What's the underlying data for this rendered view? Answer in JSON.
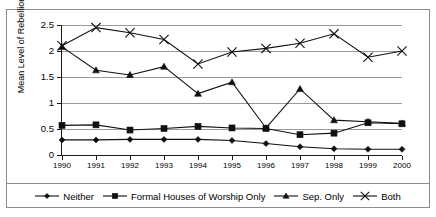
{
  "chart_data": {
    "type": "line",
    "title": "",
    "xlabel": "",
    "ylabel": "Mean Level of Rebellion",
    "categories": [
      "1990",
      "1991",
      "1992",
      "1993",
      "1994",
      "1995",
      "1996",
      "1997",
      "1998",
      "1999",
      "2000"
    ],
    "ylim": [
      0,
      2.5
    ],
    "yticks": [
      "0",
      "0.5",
      "1",
      "1.5",
      "2",
      "2.5"
    ],
    "ytick_values": [
      0,
      0.5,
      1,
      1.5,
      2,
      2.5
    ],
    "grid": true,
    "legend_position": "bottom",
    "series": [
      {
        "name": "Neither",
        "marker": "diamond",
        "values": [
          0.29,
          0.29,
          0.3,
          0.3,
          0.3,
          0.28,
          0.22,
          0.16,
          0.12,
          0.11,
          0.11
        ]
      },
      {
        "name": "Formal Houses of Worship Only",
        "marker": "square",
        "values": [
          0.57,
          0.58,
          0.48,
          0.51,
          0.55,
          0.52,
          0.51,
          0.39,
          0.42,
          0.62,
          0.6
        ]
      },
      {
        "name": "Sep. Only",
        "marker": "triangle",
        "values": [
          2.08,
          1.63,
          1.54,
          1.7,
          1.18,
          1.4,
          0.52,
          1.27,
          0.67,
          0.64,
          0.61
        ]
      },
      {
        "name": "Both",
        "marker": "cross",
        "values": [
          2.1,
          2.45,
          2.35,
          2.22,
          1.75,
          1.98,
          2.05,
          2.15,
          2.33,
          1.88,
          2.0
        ]
      }
    ]
  },
  "colors": {
    "series_stroke": "#101010",
    "gridline": "#9a9a9a",
    "axis": "#1a1a1a",
    "frame": "#8c8c8c",
    "background": "#ffffff"
  },
  "axis": {
    "y_title": "Mean Level of Rebellion",
    "y_ticks": [
      "2.5",
      "2",
      "1.5",
      "1",
      "0.5",
      "0"
    ],
    "x_ticks": [
      "1990",
      "1991",
      "1992",
      "1993",
      "1994",
      "1995",
      "1996",
      "1997",
      "1998",
      "1999",
      "2000"
    ]
  },
  "legend": {
    "items": [
      {
        "label": "Neither",
        "marker": "diamond"
      },
      {
        "label": "Formal Houses of Worship Only",
        "marker": "square"
      },
      {
        "label": "Sep. Only",
        "marker": "triangle"
      },
      {
        "label": "Both",
        "marker": "cross"
      }
    ]
  }
}
